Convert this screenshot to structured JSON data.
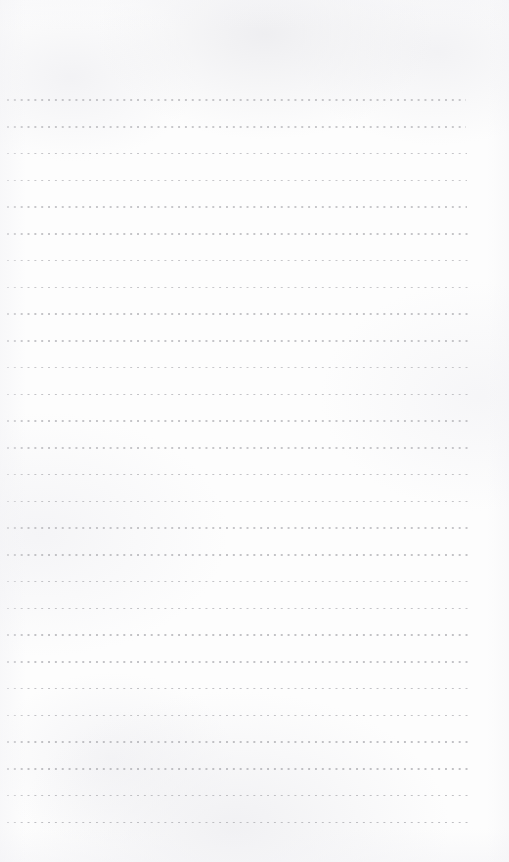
{
  "page": {
    "kind": "dotted-ruled-notebook-sheet",
    "width": 509,
    "height": 862,
    "paper_color": "#fdfdfd",
    "texture_color": "#f0f0f3",
    "title": "",
    "visible_text": "",
    "handwriting": "none",
    "printed_content": "none"
  },
  "ruling": {
    "style": "dotted",
    "row_count": 28,
    "first_row_y": 100,
    "row_spacing": 26.75,
    "last_row_y": 822,
    "dot_color": "#b9b9bd",
    "dot_size": 1.6,
    "dot_spacing": 6.85,
    "left_margin": 7,
    "right_edge": 470,
    "top_margin": 96,
    "bottom_margin": 39
  },
  "rows": [
    {
      "index": 1,
      "y": 100.0,
      "x_start": 7,
      "x_end": 466,
      "opacity": 0.8
    },
    {
      "index": 2,
      "y": 126.8,
      "x_start": 7,
      "x_end": 466,
      "opacity": 0.78
    },
    {
      "index": 3,
      "y": 153.5,
      "x_start": 7,
      "x_end": 467,
      "opacity": 0.82
    },
    {
      "index": 4,
      "y": 180.3,
      "x_start": 7,
      "x_end": 467,
      "opacity": 0.8
    },
    {
      "index": 5,
      "y": 207.0,
      "x_start": 7,
      "x_end": 467,
      "opacity": 0.79
    },
    {
      "index": 6,
      "y": 233.8,
      "x_start": 7,
      "x_end": 468,
      "opacity": 0.83
    },
    {
      "index": 7,
      "y": 260.5,
      "x_start": 7,
      "x_end": 468,
      "opacity": 0.81
    },
    {
      "index": 8,
      "y": 287.3,
      "x_start": 7,
      "x_end": 468,
      "opacity": 0.8
    },
    {
      "index": 9,
      "y": 314.0,
      "x_start": 7,
      "x_end": 468,
      "opacity": 0.84
    },
    {
      "index": 10,
      "y": 340.8,
      "x_start": 7,
      "x_end": 469,
      "opacity": 0.82
    },
    {
      "index": 11,
      "y": 367.5,
      "x_start": 7,
      "x_end": 469,
      "opacity": 0.8
    },
    {
      "index": 12,
      "y": 394.3,
      "x_start": 7,
      "x_end": 469,
      "opacity": 0.85
    },
    {
      "index": 13,
      "y": 421.0,
      "x_start": 7,
      "x_end": 469,
      "opacity": 0.83
    },
    {
      "index": 14,
      "y": 447.8,
      "x_start": 7,
      "x_end": 469,
      "opacity": 0.81
    },
    {
      "index": 15,
      "y": 474.5,
      "x_start": 7,
      "x_end": 470,
      "opacity": 0.85
    },
    {
      "index": 16,
      "y": 501.3,
      "x_start": 7,
      "x_end": 470,
      "opacity": 0.84
    },
    {
      "index": 17,
      "y": 528.0,
      "x_start": 7,
      "x_end": 470,
      "opacity": 0.82
    },
    {
      "index": 18,
      "y": 554.8,
      "x_start": 7,
      "x_end": 470,
      "opacity": 0.86
    },
    {
      "index": 19,
      "y": 581.5,
      "x_start": 7,
      "x_end": 470,
      "opacity": 0.84
    },
    {
      "index": 20,
      "y": 608.3,
      "x_start": 7,
      "x_end": 471,
      "opacity": 0.85
    },
    {
      "index": 21,
      "y": 635.0,
      "x_start": 7,
      "x_end": 471,
      "opacity": 0.87
    },
    {
      "index": 22,
      "y": 661.8,
      "x_start": 7,
      "x_end": 471,
      "opacity": 0.85
    },
    {
      "index": 23,
      "y": 688.5,
      "x_start": 7,
      "x_end": 471,
      "opacity": 0.88
    },
    {
      "index": 24,
      "y": 715.3,
      "x_start": 7,
      "x_end": 471,
      "opacity": 0.86
    },
    {
      "index": 25,
      "y": 742.0,
      "x_start": 7,
      "x_end": 472,
      "opacity": 0.88
    },
    {
      "index": 26,
      "y": 768.8,
      "x_start": 7,
      "x_end": 472,
      "opacity": 0.9
    },
    {
      "index": 27,
      "y": 795.5,
      "x_start": 7,
      "x_end": 472,
      "opacity": 0.9
    },
    {
      "index": 28,
      "y": 822.3,
      "x_start": 7,
      "x_end": 472,
      "opacity": 0.92
    }
  ]
}
